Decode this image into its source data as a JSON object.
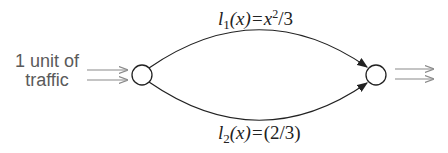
{
  "source_label": {
    "line1": "1 unit of",
    "line2": "traffic"
  },
  "edges": [
    {
      "id": "top",
      "fn_name": "l",
      "subscript": "1",
      "arg": "(x)=",
      "expr_base": "x",
      "expr_sup": "2",
      "expr_tail": "/3"
    },
    {
      "id": "bottom",
      "fn_name": "l",
      "subscript": "2",
      "arg": "(x)=",
      "expr": "(2/3)"
    }
  ],
  "colors": {
    "text_gray": "#5a5a5a",
    "arrow_gray": "#8a8a8a",
    "edge": "#222222"
  }
}
